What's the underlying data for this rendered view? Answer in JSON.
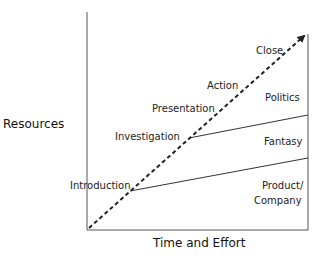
{
  "diagram": {
    "axes": {
      "y_label": "Resources",
      "x_label": "Time and Effort"
    },
    "stages": [
      "Introduction",
      "Investigation",
      "Presentation",
      "Action",
      "Close"
    ],
    "regions": {
      "top": "Politics",
      "middle": "Fantasy",
      "bottom_line1": "Product/",
      "bottom_line2": "Company"
    },
    "colors": {
      "line": "#333333",
      "text": "#222222"
    }
  }
}
